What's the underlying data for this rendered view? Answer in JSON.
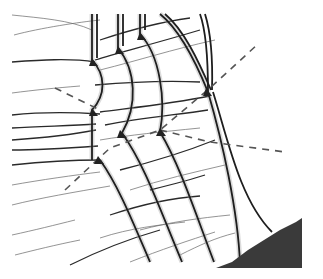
{
  "figure": {
    "colors": {
      "background": "#ffffff",
      "shock": "#1e1e1e",
      "wave": "#2a2a2a",
      "trajectory": "#555555",
      "wedge": "#3a3a3a"
    },
    "incident_shocks": [
      {
        "x_top": 92,
        "y_start": 14,
        "bulge_x": 104,
        "y_triple1": 60,
        "y_triple2": 105
      },
      {
        "x_top": 118,
        "y_start": 14,
        "bulge_x": 134,
        "y_triple1": 48,
        "y_triple2": 135
      },
      {
        "x_top": 140,
        "y_start": 14,
        "bulge_x": 160,
        "y_triple1": 34,
        "y_triple2": 132
      },
      {
        "x_top": 160,
        "y_start": 14,
        "bulge_x": 188,
        "y_triple1": 14,
        "y_triple2": 90
      }
    ],
    "lower_shocks": [
      "M100,160 C118,185 132,220 150,262",
      "M122,133 C145,165 160,210 182,262",
      "M160,132 C180,165 196,215 214,262",
      "M208,92 C222,140 238,210 240,264"
    ],
    "trajectories": [
      "M55,88 L100,110",
      "M65,190 L110,148 L160,130 L210,88 L258,44",
      "M160,130 L210,142 L285,152"
    ],
    "wedge_polygon": "216,268 232,262 240,256 248,250 256,245 264,240 272,235 280,230 288,226 296,222 302,218 302,268"
  }
}
